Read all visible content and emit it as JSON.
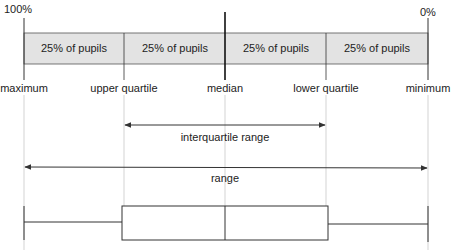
{
  "diagram": {
    "top_labels": {
      "left": "100%",
      "right": "0%"
    },
    "band_segments": [
      "25% of pupils",
      "25% of pupils",
      "25% of pupils",
      "25% of pupils"
    ],
    "markers": [
      "maximum",
      "upper quartile",
      "median",
      "lower quartile",
      "minimum"
    ],
    "interquartile_label": "interquartile range",
    "range_label": "range",
    "colors": {
      "band_fill": "#e3e3e3",
      "line": "#333333",
      "guide": "#c8c8c8"
    }
  }
}
